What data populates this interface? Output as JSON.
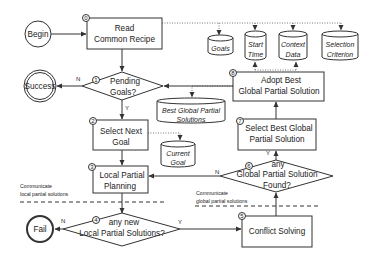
{
  "diagram": {
    "type": "flowchart",
    "terminals": {
      "begin": "Begin",
      "success": "Success",
      "fail": "Fail"
    },
    "steps": [
      {
        "id": "0",
        "line1": "Read",
        "line2": "Common Recipe"
      },
      {
        "id": "1",
        "line1": "Pending",
        "line2": "Goals?"
      },
      {
        "id": "2",
        "line1": "Select Next",
        "line2": "Goal"
      },
      {
        "id": "3",
        "line1": "Local Partial",
        "line2": "Planning"
      },
      {
        "id": "4",
        "line1": "any new",
        "line2": "Local Partial Solutions?"
      },
      {
        "id": "5",
        "line1": "Conflict Solving",
        "line2": ""
      },
      {
        "id": "6",
        "line1": "any",
        "line2": "Global Partial Solution",
        "line3": "Found?"
      },
      {
        "id": "7",
        "line1": "Select Best Global",
        "line2": "Partial Solution"
      },
      {
        "id": "8",
        "line1": "Adopt Best",
        "line2": "Global Partial Solution"
      }
    ],
    "datastores": [
      {
        "name": "goals",
        "line1": "Goals",
        "line2": ""
      },
      {
        "name": "start-time",
        "line1": "Start",
        "line2": "Time"
      },
      {
        "name": "context-data",
        "line1": "Context",
        "line2": "Data"
      },
      {
        "name": "selection-criterion",
        "line1": "Selection",
        "line2": "Criterion"
      },
      {
        "name": "best-global-partial-solutions",
        "line1": "Best Global Partial",
        "line2": "Solutions"
      },
      {
        "name": "current-goal",
        "line1": "Current",
        "line2": "Goal"
      }
    ],
    "branch_labels": {
      "yes": "Y",
      "no": "N"
    },
    "annotations": {
      "local_line1": "Communicate",
      "local_line2": "local partial solutions",
      "global_line1": "Communicate",
      "global_line2": "global partial solutions"
    }
  }
}
